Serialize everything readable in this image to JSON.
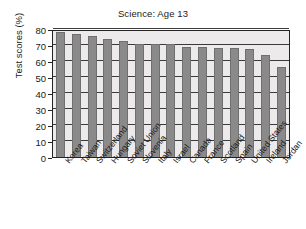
{
  "chart_data": {
    "type": "bar",
    "title": "Science: Age 13",
    "xlabel": "",
    "ylabel": "Test scores (%)",
    "ylim": [
      0,
      80
    ],
    "yticks": [
      0,
      10,
      20,
      30,
      40,
      50,
      60,
      70,
      80
    ],
    "grid": true,
    "legend": null,
    "categories": [
      "Korea",
      "Taiwan",
      "Switzerland",
      "Hungary",
      "Soviet Union",
      "Slovenia",
      "Italy",
      "Israel",
      "Canada",
      "France",
      "Scotland",
      "Spain",
      "United States",
      "Ireland",
      "Jordan"
    ],
    "values": [
      78,
      77,
      75.5,
      74,
      72.5,
      70.5,
      70.5,
      70.5,
      69,
      69,
      68,
      68,
      67.5,
      63.5,
      56
    ],
    "colors": {
      "bar_fill": "#8a8a8a",
      "bar_edge": "#6f6f6f",
      "plot_background": "#eceaea",
      "axis": "#232323",
      "gridline": "#3a3a3a",
      "text": "#1a1a1a",
      "figure_background": "#ffffff"
    }
  }
}
